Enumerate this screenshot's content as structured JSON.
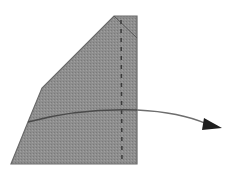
{
  "diagram": {
    "type": "folding-step",
    "paper_fill": "#8c8c8c",
    "edge_color": "#555555",
    "fold_line": "dashed-vertical",
    "arrow_direction": "right"
  }
}
